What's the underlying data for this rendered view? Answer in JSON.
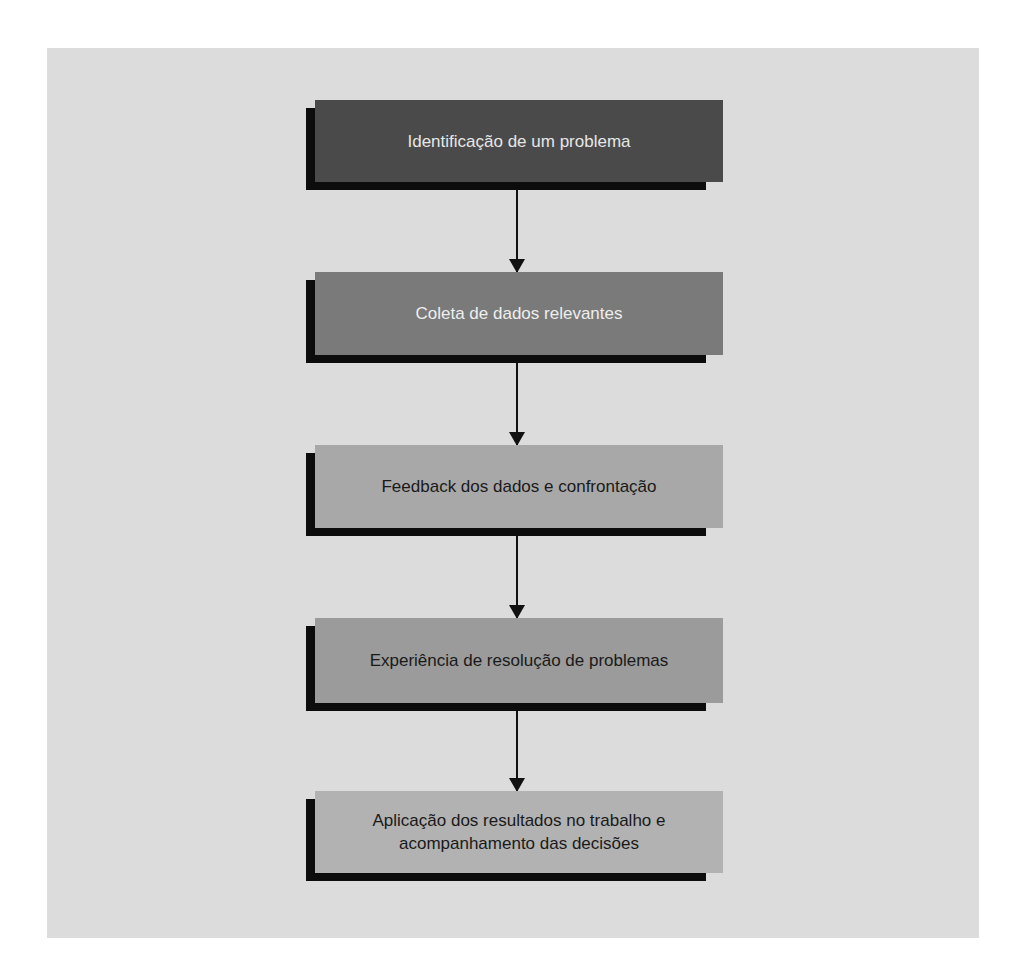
{
  "diagram": {
    "type": "vertical-flowchart",
    "background_color": "#dcdcdc",
    "shadow_color": "#0c0c0c",
    "arrow_color": "#111111",
    "steps": [
      {
        "label": "Identificação de um problema",
        "fill_color": "#4a4a4a",
        "text_color": "#e6e6e6",
        "top": 100,
        "height": 82
      },
      {
        "label": "Coleta de dados relevantes",
        "fill_color": "#7a7a7a",
        "text_color": "#eeeeee",
        "top": 272,
        "height": 83
      },
      {
        "label": "Feedback dos dados e confrontação",
        "fill_color": "#a8a8a8",
        "text_color": "#1a1a1a",
        "top": 445,
        "height": 83
      },
      {
        "label": "Experiência de resolução de problemas",
        "fill_color": "#9b9b9b",
        "text_color": "#1a1a1a",
        "top": 618,
        "height": 85
      },
      {
        "label": "Aplicação dos resultados no trabalho e acompanhamento das decisões",
        "fill_color": "#b2b2b2",
        "text_color": "#1a1a1a",
        "top": 791,
        "height": 82
      }
    ],
    "connections": [
      {
        "from": 0,
        "to": 1
      },
      {
        "from": 1,
        "to": 2
      },
      {
        "from": 2,
        "to": 3
      },
      {
        "from": 3,
        "to": 4
      }
    ]
  }
}
